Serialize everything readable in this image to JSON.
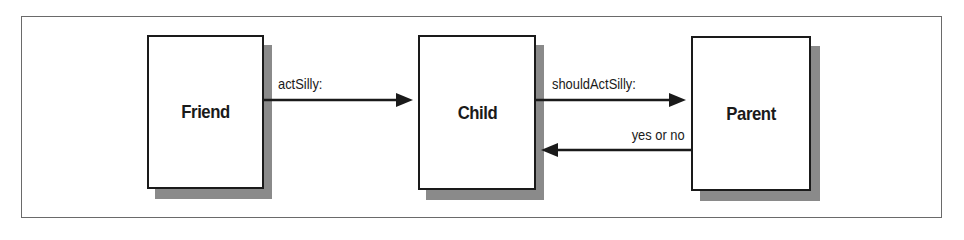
{
  "diagram": {
    "type": "message-flow",
    "colors": {
      "stroke": "#1a1a1a",
      "shadow": "#8a8a8a",
      "frame": "#6a6a6a",
      "background": "#ffffff"
    },
    "nodes": [
      {
        "id": "friend",
        "label": "Friend"
      },
      {
        "id": "child",
        "label": "Child"
      },
      {
        "id": "parent",
        "label": "Parent"
      }
    ],
    "edges": [
      {
        "from": "friend",
        "to": "child",
        "label": "actSilly:"
      },
      {
        "from": "child",
        "to": "parent",
        "label": "shouldActSilly:"
      },
      {
        "from": "parent",
        "to": "child",
        "label": "yes or no"
      }
    ]
  }
}
